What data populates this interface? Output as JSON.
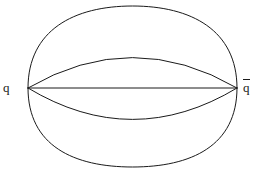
{
  "figure": {
    "kind": "feynman-like-diagram",
    "background_color": "#ffffff",
    "line_color": "#1a1a1a",
    "line_width": 1,
    "width": 258,
    "height": 169
  },
  "labels": {
    "left": "q",
    "right_base": "q",
    "right_overbar": true,
    "right_display": "q̄"
  },
  "vertices": {
    "left": {
      "x": 28,
      "y": 88
    },
    "right": {
      "x": 237,
      "y": 88
    }
  },
  "lines": [
    {
      "name": "straight-line",
      "type": "line",
      "x1": 28,
      "y1": 88,
      "x2": 237,
      "y2": 88
    }
  ],
  "arcs": [
    {
      "name": "outer-upper-arc",
      "type": "quadratic",
      "x1": 28,
      "y1": 88,
      "cx": 132.5,
      "cy": -72,
      "x2": 237,
      "y2": 88,
      "apex_y": 6
    },
    {
      "name": "inner-upper-arc",
      "type": "quadratic",
      "x1": 28,
      "y1": 88,
      "cx": 132.5,
      "cy": 27,
      "x2": 237,
      "y2": 88,
      "apex_y": 57
    },
    {
      "name": "inner-lower-arc",
      "type": "quadratic",
      "x1": 28,
      "y1": 88,
      "cx": 132.5,
      "cy": 151,
      "x2": 237,
      "y2": 88,
      "apex_y": 119
    },
    {
      "name": "outer-lower-arc",
      "type": "quadratic",
      "x1": 28,
      "y1": 88,
      "cx": 132.5,
      "cy": 243,
      "x2": 237,
      "y2": 88,
      "apex_y": 165
    },
    {
      "name": "left-cap-arc",
      "type": "quadratic",
      "x1": 28,
      "y1": 8,
      "cx": 15,
      "cy": 88,
      "x2": 28,
      "y2": 167,
      "apex_x": 24
    },
    {
      "name": "right-cap-arc",
      "type": "quadratic",
      "x1": 237,
      "y1": 8,
      "cx": 250,
      "cy": 88,
      "x2": 237,
      "y2": 167,
      "apex_x": 241
    }
  ],
  "top_artifact": {
    "text": "·  ·   ·  ·   ·  ·",
    "visible": true
  }
}
